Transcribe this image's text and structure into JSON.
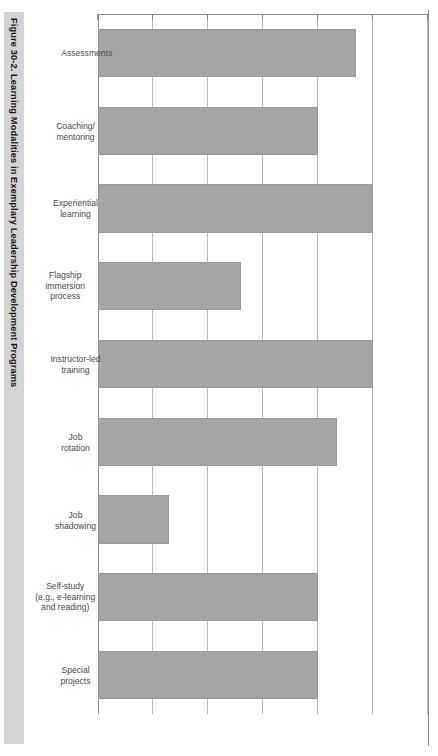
{
  "figure": {
    "title": "Figure 30-2. Learning Modalities in Exemplary Leadership Development Programs",
    "banner_color": "#d4d4d4",
    "bar_color": "#a5a5a5",
    "grid_color": "#b9b9b9",
    "axis_color": "#8d8d8d",
    "orientation": "rotated-90-clockwise"
  },
  "chart_data": {
    "type": "bar",
    "title": "Figure 30-2. Learning Modalities in Exemplary Leadership Development Programs",
    "xlabel": "",
    "ylabel": "",
    "orientation": "vertical",
    "grid": true,
    "legend": false,
    "ylim": [
      0,
      120
    ],
    "yticks": [
      0,
      20,
      40,
      60,
      80,
      100,
      120
    ],
    "ytick_labels": [
      "0%",
      "20%",
      "40%",
      "60%",
      "80%",
      "100%",
      "120%"
    ],
    "categories": [
      "Assessments",
      "Coaching/\nmentoring",
      "Experiential\nlearning",
      "Flagship\nimmersion\nprocess",
      "Instructor-led\ntraining",
      "Job\nrotation",
      "Job\nshadowing",
      "Self-study\n(e.g., e-learning\nand reading)",
      "Special\nprojects"
    ],
    "values": [
      94,
      80,
      100,
      52,
      100,
      87,
      26,
      80,
      80
    ],
    "value_labels": [
      "94%",
      "80%",
      "100%",
      "52%",
      "100%",
      "87%",
      "26%",
      "80%",
      "80%"
    ]
  }
}
